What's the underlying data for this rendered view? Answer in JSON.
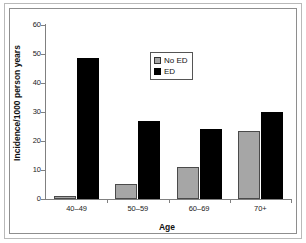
{
  "chart_data": {
    "type": "bar",
    "title": "",
    "xlabel": "Age",
    "ylabel": "Incidence/1000 person years",
    "categories": [
      "40–49",
      "50–59",
      "60–69",
      "70+"
    ],
    "series": [
      {
        "name": "No ED",
        "color": "#a6a6a6",
        "values": [
          1,
          5.2,
          11,
          23.5
        ]
      },
      {
        "name": "ED",
        "color": "#000000",
        "values": [
          48.5,
          27,
          24,
          30
        ]
      }
    ],
    "ylim": [
      0,
      60
    ],
    "yticks": [
      0,
      10,
      20,
      30,
      40,
      50,
      60
    ],
    "ytick_labels": [
      "0",
      "10",
      "20",
      "30",
      "40",
      "50",
      "60"
    ],
    "grid": false,
    "legend_position": "upper-center"
  },
  "legend": {
    "items": [
      {
        "label": "No ED",
        "swatch": "gray-swatch-icon"
      },
      {
        "label": "ED",
        "swatch": "black-swatch-icon"
      }
    ]
  }
}
